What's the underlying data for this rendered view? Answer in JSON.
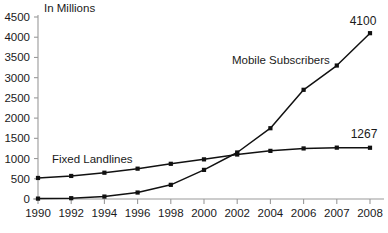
{
  "chart_data": {
    "type": "line",
    "title": "",
    "subtitle": "",
    "axis_note": "In Millions",
    "xlabel": "",
    "ylabel": "",
    "categories": [
      "1990",
      "1992",
      "1994",
      "1996",
      "1998",
      "2000",
      "2002",
      "2004",
      "2006",
      "2007",
      "2008"
    ],
    "ylim": [
      0,
      4500
    ],
    "ytick_labels": [
      "0",
      "500",
      "1000",
      "1500",
      "2000",
      "2500",
      "3000",
      "3500",
      "4000",
      "4500"
    ],
    "ytick_values": [
      0,
      500,
      1000,
      1500,
      2000,
      2500,
      3000,
      3500,
      4000,
      4500
    ],
    "grid": false,
    "legend_position": "inline-annotations",
    "series": [
      {
        "name": "Fixed Landlines",
        "values": [
          520,
          570,
          650,
          750,
          870,
          980,
          1100,
          1190,
          1250,
          1270,
          1267
        ],
        "end_label": "1267",
        "marker": "square",
        "color": "#111111"
      },
      {
        "name": "Mobile Subscribers",
        "values": [
          10,
          20,
          60,
          160,
          350,
          720,
          1150,
          1750,
          2700,
          3300,
          4100
        ],
        "end_label": "4100",
        "marker": "square",
        "color": "#111111"
      }
    ],
    "annotations": [
      {
        "text": "Fixed Landlines",
        "near_category": "1992"
      },
      {
        "text": "Mobile Subscribers",
        "near_category": "2004"
      },
      {
        "text": "4100",
        "near_category": "2008"
      },
      {
        "text": "1267",
        "near_category": "2008"
      }
    ]
  }
}
